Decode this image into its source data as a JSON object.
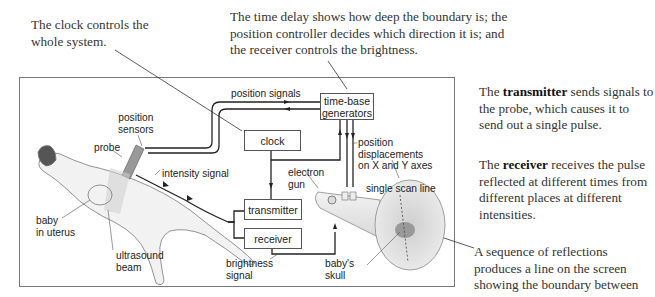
{
  "annotations": {
    "clock_note": "The clock controls the whole system.",
    "time_delay_note": "The time delay shows how deep the boundary is; the position controller decides which direction it is; and the receiver controls the brightness.",
    "transmitter_note": {
      "prefix": "The ",
      "bold": "transmitter",
      "suffix": " sends signals to the probe, which causes it to send out a single pulse."
    },
    "receiver_note": {
      "prefix": "The ",
      "bold": "receiver",
      "suffix": " receives the pulse reflected at different times from different places at different intensities."
    },
    "sequence_note": "A sequence of reflections produces a line on the screen showing the boundary between"
  },
  "components": {
    "clock": "clock",
    "time_base_line1": "time-base",
    "time_base_line2": "generators",
    "transmitter": "transmitter",
    "receiver": "receiver"
  },
  "labels": {
    "position_signals": "position signals",
    "position_sensors_1": "position",
    "position_sensors_2": "sensors",
    "probe": "probe",
    "intensity_signal": "intensity signal",
    "baby_1": "baby",
    "baby_2": "in uterus",
    "ultrasound_1": "ultrasound",
    "ultrasound_2": "beam",
    "electron_1": "electron",
    "electron_2": "gun",
    "position_disp_1": "position",
    "position_disp_2": "displacements",
    "position_disp_3": "on X and Y axes",
    "single_scan_line": "single scan line",
    "brightness_1": "brightness",
    "brightness_2": "signal",
    "skull_1": "baby's",
    "skull_2": "skull"
  }
}
